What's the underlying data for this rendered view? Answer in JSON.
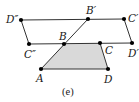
{
  "figure": {
    "caption": "(e)",
    "colors": {
      "line": "#333333",
      "point": "#000000",
      "shade": "#d9d9d9"
    },
    "points": [
      {
        "id": "D2",
        "label": "D″"
      },
      {
        "id": "B1",
        "label": "B′"
      },
      {
        "id": "C1",
        "label": "C′"
      },
      {
        "id": "C2",
        "label": "C″"
      },
      {
        "id": "B",
        "label": "B"
      },
      {
        "id": "C",
        "label": "C"
      },
      {
        "id": "D1",
        "label": "D′"
      },
      {
        "id": "A",
        "label": "A"
      },
      {
        "id": "D",
        "label": "D"
      }
    ],
    "shaded_polygon": [
      "A",
      "B",
      "C",
      "D"
    ],
    "segments": [
      [
        "D2",
        "C1"
      ],
      [
        "C1",
        "D1"
      ],
      [
        "C2",
        "D1"
      ],
      [
        "D2",
        "C2"
      ],
      [
        "A",
        "B1"
      ],
      [
        "A",
        "D"
      ],
      [
        "C",
        "D"
      ]
    ]
  }
}
